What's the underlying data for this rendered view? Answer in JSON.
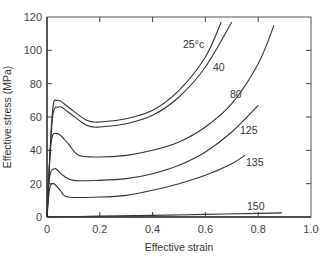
{
  "chart_data": {
    "type": "line",
    "title": "",
    "xlabel": "Effective strain",
    "ylabel": "Effective stress (MPa)",
    "xlim": [
      0,
      1.0
    ],
    "ylim": [
      0,
      120
    ],
    "x_ticks": [
      "0",
      "0.2",
      "0.4",
      "0.6",
      "0.8",
      "1.0"
    ],
    "y_ticks": [
      "0",
      "20",
      "40",
      "60",
      "80",
      "100",
      "120"
    ],
    "grid": false,
    "legend": "inline labels at curve ends",
    "series": [
      {
        "name": "25°c",
        "x": [
          0,
          0.02,
          0.04,
          0.08,
          0.15,
          0.2,
          0.3,
          0.4,
          0.5,
          0.6,
          0.66
        ],
        "y": [
          0,
          62,
          70,
          66,
          58,
          57,
          59,
          64,
          76,
          96,
          117
        ]
      },
      {
        "name": "40",
        "x": [
          0,
          0.02,
          0.045,
          0.08,
          0.15,
          0.2,
          0.3,
          0.4,
          0.5,
          0.6,
          0.7
        ],
        "y": [
          0,
          58,
          66,
          63,
          55,
          54,
          56,
          61,
          72,
          90,
          117
        ]
      },
      {
        "name": "80",
        "x": [
          0,
          0.015,
          0.04,
          0.08,
          0.12,
          0.2,
          0.3,
          0.4,
          0.5,
          0.6,
          0.7,
          0.8,
          0.86
        ],
        "y": [
          0,
          44,
          50,
          44,
          37,
          36,
          37,
          40,
          45,
          54,
          68,
          92,
          115
        ]
      },
      {
        "name": "125",
        "x": [
          0,
          0.01,
          0.03,
          0.06,
          0.1,
          0.2,
          0.3,
          0.4,
          0.5,
          0.6,
          0.7,
          0.8
        ],
        "y": [
          0,
          24,
          29,
          25,
          22,
          22,
          23,
          26,
          31,
          39,
          51,
          67
        ]
      },
      {
        "name": "135",
        "x": [
          0,
          0.01,
          0.025,
          0.05,
          0.08,
          0.2,
          0.3,
          0.4,
          0.5,
          0.6,
          0.7,
          0.75
        ],
        "y": [
          0,
          17,
          20,
          16,
          12,
          12,
          13,
          16,
          20,
          25,
          32,
          37
        ]
      },
      {
        "name": "150",
        "x": [
          0,
          0.2,
          0.4,
          0.6,
          0.8,
          0.89
        ],
        "y": [
          0,
          0.5,
          1.0,
          1.6,
          2.2,
          2.5
        ]
      }
    ]
  }
}
